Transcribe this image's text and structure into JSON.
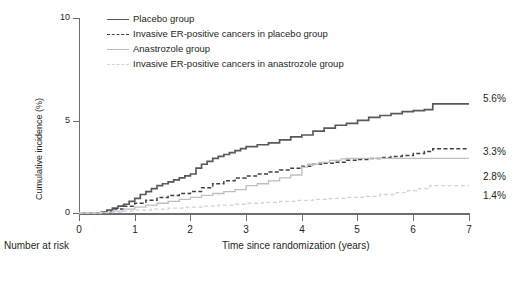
{
  "chart_data": {
    "type": "line",
    "title": "",
    "xlabel": "Time since randomization (years)",
    "ylabel": "Cumulative incidence (%)",
    "xlim": [
      0,
      7
    ],
    "ylim": [
      0,
      10
    ],
    "xticks": [
      "0",
      "1",
      "2",
      "3",
      "4",
      "5",
      "6",
      "7"
    ],
    "yticks": [
      "0",
      "5",
      "10"
    ],
    "grid": false,
    "legend_position": "top-left",
    "below_axis_note": "Number at risk",
    "series": [
      {
        "name": "Placebo group",
        "style": "solid",
        "color": "#58595b",
        "end_label": "5.6%",
        "x": [
          0,
          0.4,
          0.5,
          0.6,
          0.7,
          0.8,
          0.9,
          1.0,
          1.1,
          1.2,
          1.3,
          1.4,
          1.5,
          1.6,
          1.7,
          1.8,
          1.9,
          2.0,
          2.1,
          2.2,
          2.3,
          2.4,
          2.5,
          2.6,
          2.7,
          2.8,
          2.9,
          3.0,
          3.2,
          3.4,
          3.6,
          3.8,
          4.0,
          4.2,
          4.4,
          4.6,
          4.8,
          5.0,
          5.2,
          5.4,
          5.6,
          5.8,
          6.0,
          6.2,
          6.35,
          6.5,
          7.0
        ],
        "y": [
          0,
          0.05,
          0.15,
          0.25,
          0.35,
          0.45,
          0.6,
          0.75,
          0.95,
          1.1,
          1.25,
          1.4,
          1.5,
          1.6,
          1.7,
          1.8,
          1.9,
          2.0,
          2.3,
          2.5,
          2.65,
          2.8,
          2.9,
          3.0,
          3.1,
          3.2,
          3.3,
          3.4,
          3.5,
          3.6,
          3.75,
          3.9,
          4.0,
          4.2,
          4.35,
          4.5,
          4.6,
          4.75,
          4.9,
          5.0,
          5.1,
          5.2,
          5.25,
          5.3,
          5.6,
          5.6,
          5.6
        ]
      },
      {
        "name": "Invasive ER-positive cancers in placebo group",
        "style": "dashed",
        "color": "#414042",
        "end_label": "3.3%",
        "x": [
          0,
          0.4,
          0.6,
          0.8,
          1.0,
          1.2,
          1.4,
          1.6,
          1.8,
          2.0,
          2.2,
          2.4,
          2.6,
          2.8,
          3.0,
          3.2,
          3.4,
          3.6,
          3.8,
          4.0,
          4.2,
          4.4,
          4.6,
          4.8,
          5.0,
          5.2,
          5.4,
          5.6,
          5.8,
          6.0,
          6.2,
          6.35,
          7.0
        ],
        "y": [
          0,
          0.05,
          0.2,
          0.35,
          0.5,
          0.65,
          0.8,
          0.9,
          1.0,
          1.1,
          1.3,
          1.5,
          1.65,
          1.8,
          1.9,
          2.0,
          2.1,
          2.2,
          2.3,
          2.4,
          2.5,
          2.55,
          2.6,
          2.7,
          2.75,
          2.8,
          2.85,
          2.9,
          2.95,
          3.05,
          3.15,
          3.3,
          3.3
        ]
      },
      {
        "name": "Anastrozole group",
        "style": "solid",
        "color": "#bcbec0",
        "end_label": "2.8%",
        "x": [
          0,
          0.4,
          0.6,
          0.8,
          1.0,
          1.2,
          1.4,
          1.6,
          1.8,
          2.0,
          2.2,
          2.4,
          2.6,
          2.8,
          3.0,
          3.2,
          3.4,
          3.6,
          3.8,
          4.0,
          4.1,
          4.3,
          4.5,
          4.7,
          4.8,
          5.0,
          5.5,
          6.0,
          6.35,
          7.0
        ],
        "y": [
          0,
          0.03,
          0.1,
          0.2,
          0.3,
          0.4,
          0.5,
          0.6,
          0.7,
          0.8,
          0.9,
          1.0,
          1.1,
          1.2,
          1.4,
          1.5,
          1.65,
          1.8,
          1.95,
          2.35,
          2.5,
          2.6,
          2.7,
          2.78,
          2.8,
          2.8,
          2.8,
          2.8,
          2.8,
          2.8
        ]
      },
      {
        "name": "Invasive ER-positive cancers in anastrozole group",
        "style": "dashed",
        "color": "#d1d3d4",
        "end_label": "1.4%",
        "x": [
          0,
          0.4,
          0.6,
          0.8,
          1.0,
          1.3,
          1.6,
          1.9,
          2.2,
          2.5,
          2.8,
          3.0,
          3.3,
          3.6,
          3.9,
          4.2,
          4.5,
          4.8,
          5.1,
          5.4,
          5.7,
          5.9,
          6.1,
          6.3,
          6.35,
          7.0
        ],
        "y": [
          0,
          0.02,
          0.05,
          0.1,
          0.15,
          0.2,
          0.25,
          0.3,
          0.35,
          0.4,
          0.45,
          0.5,
          0.55,
          0.6,
          0.65,
          0.7,
          0.75,
          0.8,
          0.85,
          0.95,
          1.05,
          1.15,
          1.25,
          1.4,
          1.4,
          1.4
        ]
      }
    ]
  },
  "legend": {
    "items": [
      {
        "label": "Placebo group"
      },
      {
        "label": "Invasive ER-positive cancers in placebo group"
      },
      {
        "label": "Anastrozole group"
      },
      {
        "label": "Invasive ER-positive cancers in anastrozole group"
      }
    ]
  },
  "axes": {
    "x_title": "Time since randomization (years)",
    "y_title": "Cumulative incidence (%)",
    "x_ticks": [
      "0",
      "1",
      "2",
      "3",
      "4",
      "5",
      "6",
      "7"
    ],
    "y_ticks": [
      "10",
      "5",
      "0"
    ]
  },
  "notes": {
    "number_at_risk": "Number at risk"
  },
  "end_labels": [
    "5.6%",
    "3.3%",
    "2.8%",
    "1.4%"
  ],
  "colors": {
    "axis": "#6d6e71",
    "placebo": "#58595b",
    "placebo_er": "#414042",
    "anastrozole": "#bcbec0",
    "anastrozole_er": "#d1d3d4"
  }
}
